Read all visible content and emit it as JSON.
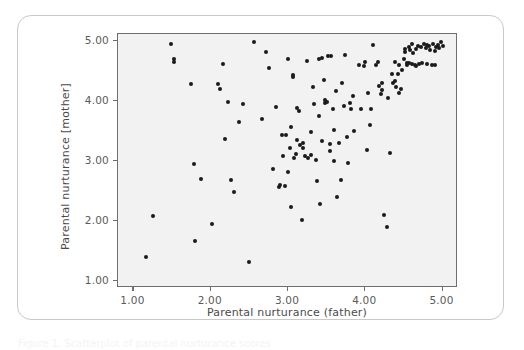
{
  "figure": {
    "caption_sliver": "Figure 1. Scatterplot of parental nurturance scores"
  },
  "chart_data": {
    "type": "scatter",
    "title": "",
    "xlabel": "Parental nurturance (father)",
    "ylabel": "Parental nurturance [mother]",
    "xlim": [
      0.8,
      5.2
    ],
    "ylim": [
      0.88,
      5.12
    ],
    "xticks": [
      1.0,
      2.0,
      3.0,
      4.0,
      5.0
    ],
    "yticks": [
      1.0,
      2.0,
      3.0,
      4.0,
      5.0
    ],
    "xticklabels": [
      "1.00",
      "2.00",
      "3.00",
      "4.00",
      "5.00"
    ],
    "yticklabels": [
      "1.00",
      "2.00",
      "3.00",
      "4.00",
      "5.00"
    ],
    "grid": false,
    "legend": false,
    "marker": {
      "shape": "circle",
      "color": "#1b1b1b",
      "size_px": 4
    },
    "plot_background": "#f2f2f2",
    "frame_color": "#6e6e6e",
    "n_points": 147,
    "points": [
      [
        1.16,
        1.4
      ],
      [
        1.25,
        2.08
      ],
      [
        1.49,
        4.96
      ],
      [
        1.52,
        4.7
      ],
      [
        1.52,
        4.65
      ],
      [
        1.74,
        4.28
      ],
      [
        1.78,
        2.95
      ],
      [
        1.8,
        1.66
      ],
      [
        1.88,
        2.7
      ],
      [
        2.02,
        1.95
      ],
      [
        2.1,
        4.28
      ],
      [
        2.12,
        4.2
      ],
      [
        2.16,
        4.62
      ],
      [
        2.18,
        3.36
      ],
      [
        2.22,
        3.98
      ],
      [
        2.26,
        2.69
      ],
      [
        2.3,
        2.49
      ],
      [
        2.36,
        3.65
      ],
      [
        2.42,
        3.95
      ],
      [
        2.5,
        1.32
      ],
      [
        2.56,
        4.99
      ],
      [
        2.66,
        3.7
      ],
      [
        2.72,
        4.82
      ],
      [
        2.76,
        4.55
      ],
      [
        2.8,
        2.87
      ],
      [
        2.84,
        3.9
      ],
      [
        2.88,
        2.57
      ],
      [
        2.9,
        2.6
      ],
      [
        2.94,
        3.08
      ],
      [
        2.96,
        2.59
      ],
      [
        2.98,
        3.43
      ],
      [
        3.0,
        2.82
      ],
      [
        3.0,
        4.7
      ],
      [
        3.02,
        3.21
      ],
      [
        3.04,
        3.57
      ],
      [
        3.04,
        2.23
      ],
      [
        3.06,
        4.44
      ],
      [
        3.07,
        4.4
      ],
      [
        3.08,
        3.05
      ],
      [
        3.1,
        3.12
      ],
      [
        3.12,
        3.88
      ],
      [
        3.14,
        3.84
      ],
      [
        3.16,
        3.26
      ],
      [
        3.18,
        2.02
      ],
      [
        3.2,
        3.22
      ],
      [
        3.2,
        3.3
      ],
      [
        3.22,
        3.08
      ],
      [
        3.24,
        4.67
      ],
      [
        3.26,
        3.05
      ],
      [
        3.3,
        3.48
      ],
      [
        3.32,
        4.23
      ],
      [
        3.34,
        3.95
      ],
      [
        3.36,
        3.02
      ],
      [
        3.38,
        2.66
      ],
      [
        3.4,
        4.7
      ],
      [
        3.4,
        3.75
      ],
      [
        3.42,
        2.28
      ],
      [
        3.44,
        4.72
      ],
      [
        3.46,
        4.36
      ],
      [
        3.48,
        4.01
      ],
      [
        3.48,
        3.96
      ],
      [
        3.5,
        3.98
      ],
      [
        3.52,
        4.76
      ],
      [
        3.54,
        3.17
      ],
      [
        3.54,
        3.29
      ],
      [
        3.56,
        4.76
      ],
      [
        3.58,
        3.86
      ],
      [
        3.6,
        3.52
      ],
      [
        3.62,
        4.17
      ],
      [
        3.64,
        2.4
      ],
      [
        3.66,
        3.3
      ],
      [
        3.68,
        2.69
      ],
      [
        3.7,
        4.3
      ],
      [
        3.72,
        3.92
      ],
      [
        3.74,
        4.77
      ],
      [
        3.76,
        3.4
      ],
      [
        3.78,
        2.97
      ],
      [
        3.8,
        3.96
      ],
      [
        3.82,
        3.86
      ],
      [
        3.84,
        4.08
      ],
      [
        3.86,
        3.5
      ],
      [
        3.94,
        3.86
      ],
      [
        3.98,
        4.58
      ],
      [
        4.0,
        4.65
      ],
      [
        4.02,
        3.19
      ],
      [
        4.04,
        4.14
      ],
      [
        4.06,
        3.6
      ],
      [
        4.08,
        3.86
      ],
      [
        4.1,
        4.94
      ],
      [
        4.14,
        4.6
      ],
      [
        4.16,
        4.66
      ],
      [
        4.18,
        4.25
      ],
      [
        4.2,
        4.12
      ],
      [
        4.22,
        4.18
      ],
      [
        4.22,
        4.31
      ],
      [
        4.24,
        2.1
      ],
      [
        4.28,
        1.89
      ],
      [
        4.3,
        4.06
      ],
      [
        4.32,
        3.14
      ],
      [
        4.34,
        4.45
      ],
      [
        4.36,
        4.3
      ],
      [
        4.38,
        4.33
      ],
      [
        4.4,
        4.24
      ],
      [
        4.42,
        4.46
      ],
      [
        4.44,
        4.14
      ],
      [
        4.46,
        4.2
      ],
      [
        4.52,
        4.87
      ],
      [
        4.52,
        4.82
      ],
      [
        4.54,
        4.64
      ],
      [
        4.54,
        4.6
      ],
      [
        4.56,
        4.9
      ],
      [
        4.58,
        4.86
      ],
      [
        4.6,
        4.96
      ],
      [
        4.6,
        4.62
      ],
      [
        4.62,
        4.8
      ],
      [
        4.64,
        4.6
      ],
      [
        4.66,
        4.87
      ],
      [
        4.68,
        4.92
      ],
      [
        4.7,
        4.62
      ],
      [
        4.72,
        4.9
      ],
      [
        4.74,
        4.63
      ],
      [
        4.76,
        4.95
      ],
      [
        4.78,
        4.88
      ],
      [
        4.8,
        4.62
      ],
      [
        4.82,
        4.92
      ],
      [
        4.84,
        4.86
      ],
      [
        4.86,
        4.61
      ],
      [
        4.88,
        4.96
      ],
      [
        4.9,
        4.84
      ],
      [
        4.92,
        4.9
      ],
      [
        4.94,
        4.94
      ],
      [
        4.96,
        4.88
      ],
      [
        4.98,
        4.98
      ],
      [
        5.0,
        4.92
      ],
      [
        4.5,
        4.7
      ],
      [
        4.48,
        4.52
      ],
      [
        4.44,
        4.6
      ],
      [
        4.38,
        4.66
      ],
      [
        4.56,
        4.64
      ],
      [
        4.66,
        4.58
      ],
      [
        4.8,
        4.94
      ],
      [
        4.9,
        4.6
      ],
      [
        3.92,
        4.6
      ],
      [
        3.3,
        3.1
      ],
      [
        3.44,
        3.34
      ],
      [
        3.12,
        3.35
      ],
      [
        3.6,
        3.0
      ],
      [
        2.92,
        3.44
      ]
    ]
  }
}
